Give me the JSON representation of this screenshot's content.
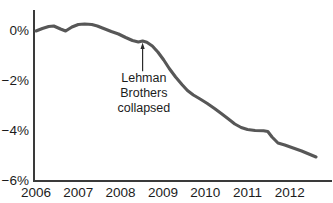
{
  "chart_data": {
    "type": "line",
    "title": "",
    "subtitle": "",
    "xlabel": "",
    "ylabel": "",
    "xlim": [
      2006.0,
      2012.62
    ],
    "ylim": [
      -6,
      0.6
    ],
    "grid": false,
    "legend": "none",
    "line_color": "#575757",
    "axis_color": "#3a3a3a",
    "text_color": "#1c1c1c",
    "y_tick_labels": [
      "0%",
      "−2%",
      "−4%",
      "−6%"
    ],
    "y_tick_values": [
      0,
      -2,
      -4,
      -6
    ],
    "x_tick_labels": [
      "2006",
      "2007",
      "2008",
      "2009",
      "2010",
      "2011",
      "2012"
    ],
    "x_tick_values": [
      2006,
      2007,
      2008,
      2009,
      2010,
      2011,
      2012
    ],
    "series": [
      {
        "name": "series-1",
        "x": [
          2006.0,
          2006.15,
          2006.3,
          2006.42,
          2006.58,
          2006.7,
          2006.85,
          2007.0,
          2007.15,
          2007.32,
          2007.45,
          2007.6,
          2007.78,
          2007.95,
          2008.12,
          2008.28,
          2008.42,
          2008.52,
          2008.62,
          2008.75,
          2008.88,
          2009.02,
          2009.15,
          2009.3,
          2009.45,
          2009.58,
          2009.72,
          2009.88,
          2010.05,
          2010.22,
          2010.38,
          2010.55,
          2010.7,
          2010.85,
          2011.0,
          2011.18,
          2011.38,
          2011.48,
          2011.58,
          2011.72,
          2011.88,
          2012.08,
          2012.28,
          2012.45,
          2012.62
        ],
        "y": [
          0.0,
          0.1,
          0.18,
          0.2,
          0.08,
          0.0,
          0.16,
          0.26,
          0.28,
          0.26,
          0.2,
          0.1,
          -0.02,
          -0.12,
          -0.26,
          -0.38,
          -0.44,
          -0.4,
          -0.45,
          -0.6,
          -0.84,
          -1.16,
          -1.5,
          -1.84,
          -2.14,
          -2.38,
          -2.56,
          -2.72,
          -2.9,
          -3.1,
          -3.3,
          -3.52,
          -3.72,
          -3.86,
          -3.94,
          -3.98,
          -3.99,
          -4.02,
          -4.24,
          -4.48,
          -4.56,
          -4.68,
          -4.8,
          -4.92,
          -5.04
        ]
      }
    ],
    "annotations": [
      {
        "name": "lehman-brothers-collapsed",
        "lines": [
          "Lehman",
          "Brothers",
          "collapsed"
        ],
        "point_x": 2008.52,
        "point_y": -0.42,
        "label_x": 2008.55,
        "label_y": -2.05
      }
    ]
  }
}
